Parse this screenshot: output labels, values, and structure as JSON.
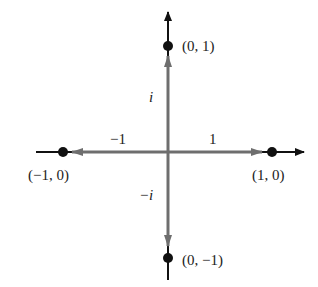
{
  "diagram": {
    "title": "",
    "points": [
      {
        "label": "(0, 1)",
        "x": 0,
        "y": 1
      },
      {
        "label": "(1, 0)",
        "x": 1,
        "y": 0
      },
      {
        "label": "(−1, 0)",
        "x": -1,
        "y": 0
      },
      {
        "label": "(0, −1)",
        "x": 0,
        "y": -1
      }
    ],
    "vectors": [
      {
        "label": "i",
        "direction": "up"
      },
      {
        "label": "1",
        "direction": "right"
      },
      {
        "label": "−1",
        "direction": "left"
      },
      {
        "label": "−i",
        "direction": "down"
      }
    ],
    "colors": {
      "axis": "#111111",
      "vector": "#6e6e6e",
      "point": "#111111"
    }
  }
}
